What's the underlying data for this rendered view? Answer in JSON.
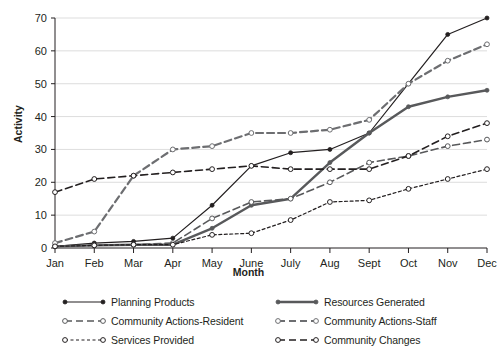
{
  "chart_data": {
    "type": "line",
    "title": "",
    "xlabel": "Month",
    "ylabel": "Activity",
    "categories": [
      "Jan",
      "Feb",
      "Mar",
      "Apr",
      "May",
      "June",
      "July",
      "Aug",
      "Sept",
      "Oct",
      "Nov",
      "Dec"
    ],
    "ylim": [
      0,
      70
    ],
    "yticks": [
      0,
      10,
      20,
      30,
      40,
      50,
      60,
      70
    ],
    "grid": "horizontal",
    "legend_position": "below",
    "series": [
      {
        "name": "Planning Products",
        "style": "solid",
        "color": "#231f20",
        "marker": "filled-circle",
        "width": 1.2,
        "values": [
          0.5,
          1.5,
          2,
          3,
          13,
          25,
          29,
          30,
          35,
          50,
          65,
          70
        ]
      },
      {
        "name": "Resources Generated",
        "style": "solid",
        "color": "#58595b",
        "marker": "filled-circle",
        "width": 2.4,
        "values": [
          0.5,
          0.8,
          1,
          1,
          6,
          13,
          15,
          26,
          35,
          43,
          46,
          48
        ]
      },
      {
        "name": "Community Actions-Resident",
        "style": "long-dash",
        "color": "#58595b",
        "marker": "open-circle",
        "width": 1.6,
        "values": [
          0.5,
          0.8,
          1,
          1.5,
          9,
          14,
          15,
          20,
          26,
          28,
          31,
          33
        ]
      },
      {
        "name": "Community Actions-Staff",
        "style": "long-dash",
        "color": "#6d6e71",
        "marker": "open-circle",
        "width": 2.2,
        "values": [
          1.5,
          5,
          22,
          30,
          31,
          35,
          35,
          36,
          39,
          50,
          57,
          62
        ]
      },
      {
        "name": "Services Provided",
        "style": "fine-dash",
        "color": "#231f20",
        "marker": "open-circle",
        "width": 1.2,
        "values": [
          0.5,
          0.8,
          1,
          1,
          4,
          4.5,
          8.5,
          14,
          14.5,
          18,
          21,
          24
        ]
      },
      {
        "name": "Community Changes",
        "style": "long-dash",
        "color": "#231f20",
        "marker": "open-circle",
        "width": 1.6,
        "values": [
          17,
          21,
          22,
          23,
          24,
          25,
          24,
          24,
          24,
          28,
          34,
          38
        ]
      }
    ]
  },
  "legend": {
    "items": [
      {
        "label": "Planning Products"
      },
      {
        "label": "Resources Generated"
      },
      {
        "label": "Community Actions-Resident"
      },
      {
        "label": "Community Actions-Staff"
      },
      {
        "label": "Services Provided"
      },
      {
        "label": "Community Changes"
      }
    ]
  },
  "axes": {
    "y_title": "Activity",
    "x_title": "Month"
  }
}
